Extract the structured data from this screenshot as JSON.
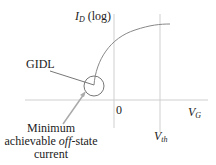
{
  "diagram": {
    "y_axis_label": {
      "main": "I",
      "sub": "D",
      "suffix": " (log)"
    },
    "x_axis_label": {
      "main": "V",
      "sub": "G"
    },
    "origin_label": "0",
    "threshold_label": {
      "main": "V",
      "sub": "th"
    },
    "gidl_label": "GIDL",
    "annotation": {
      "line1": "Minimum",
      "line2_pre": "achievable ",
      "line2_italic": "off",
      "line2_post": "-state",
      "line3": "current"
    },
    "colors": {
      "axis": "#cccccc",
      "curve": "#888888",
      "text": "#222222",
      "arrow": "#aaaaaa"
    }
  }
}
